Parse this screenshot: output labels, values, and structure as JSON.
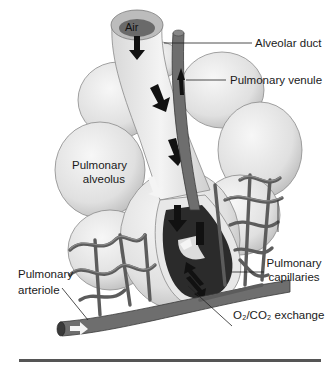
{
  "diagram": {
    "type": "anatomical-illustration",
    "labels": {
      "air": "Air",
      "alveolar_duct": "Alveolar duct",
      "pulmonary_venule": "Pulmonary venule",
      "pulmonary_alveolus_line1": "Pulmonary",
      "pulmonary_alveolus_line2": "alveolus",
      "pulmonary_capillaries_line1": "Pulmonary",
      "pulmonary_capillaries_line2": "capillaries",
      "pulmonary_arteriole_line1": "Pulmonary",
      "pulmonary_arteriole_line2": "arteriole",
      "gas_exchange": "O₂/CO₂ exchange"
    },
    "colors": {
      "alveolus_fill": "#e6e6e6",
      "alveolus_stroke": "#8a8a8a",
      "vessel_fill": "#6e6e6e",
      "vessel_stroke": "#3a3a3a",
      "cavity": "#2b2b2b",
      "leader_line": "#222222",
      "footer_rule": "#555555"
    }
  }
}
